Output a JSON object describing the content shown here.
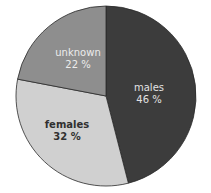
{
  "chart_data": {
    "type": "pie",
    "title": "",
    "start_angle_deg": 0,
    "direction": "clockwise",
    "categories": [
      "males",
      "females",
      "unknown"
    ],
    "values": [
      46,
      32,
      22
    ],
    "unit": "%",
    "slices": [
      {
        "label": "males",
        "value": 46,
        "value_text": "46 %",
        "color": "#3c3c3c",
        "text_color": "#e2e2e2"
      },
      {
        "label": "females",
        "value": 32,
        "value_text": "32 %",
        "color": "#d0d0d0",
        "text_color": "#303030"
      },
      {
        "label": "unknown",
        "value": 22,
        "value_text": "22 %",
        "color": "#8e8e8e",
        "text_color": "#ececec"
      }
    ],
    "legend": "none",
    "border_color": "#2a2a2a"
  }
}
